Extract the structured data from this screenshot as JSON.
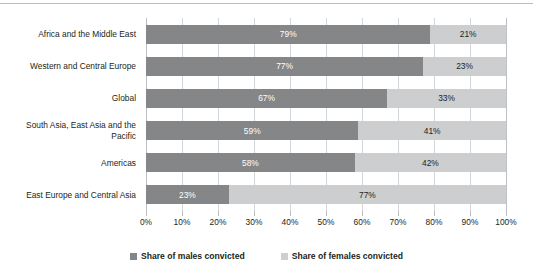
{
  "chart_data": {
    "type": "bar",
    "orientation": "horizontal",
    "stacked": true,
    "stacked_normalized": true,
    "title": "",
    "subtitle": "",
    "xlabel": "",
    "ylabel": "",
    "xlim": [
      0,
      100
    ],
    "grid": true,
    "legend_position": "bottom",
    "categories": [
      "Africa and the Middle East",
      "Western and Central Europe",
      "Global",
      "South Asia, East Asia and the Pacific",
      "Americas",
      "East Europe and Central Asia"
    ],
    "xticklabels": [
      "0%",
      "10%",
      "20%",
      "30%",
      "40%",
      "50%",
      "60%",
      "70%",
      "80%",
      "90%",
      "100%"
    ],
    "xticks": [
      0,
      10,
      20,
      30,
      40,
      50,
      60,
      70,
      80,
      90,
      100
    ],
    "series": [
      {
        "name": "Share of males convicted",
        "color": "#848688",
        "values": [
          79,
          77,
          67,
          59,
          58,
          23
        ],
        "labels": [
          "79%",
          "77%",
          "67%",
          "59%",
          "58%",
          "23%"
        ]
      },
      {
        "name": "Share of females convicted",
        "color": "#ccced0",
        "values": [
          21,
          23,
          33,
          41,
          42,
          77
        ],
        "labels": [
          "21%",
          "23%",
          "33%",
          "41%",
          "42%",
          "77%"
        ]
      }
    ]
  },
  "legend": {
    "items": [
      {
        "label": "Share of males convicted",
        "color": "#848688"
      },
      {
        "label": "Share of females convicted",
        "color": "#ccced0"
      }
    ]
  },
  "category_lines": [
    [
      "Africa and the Middle East"
    ],
    [
      "Western and Central Europe"
    ],
    [
      "Global"
    ],
    [
      "South Asia, East Asia and the",
      "Pacific"
    ],
    [
      "Americas"
    ],
    [
      "East Europe and Central Asia"
    ]
  ]
}
